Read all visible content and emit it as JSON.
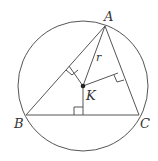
{
  "diagram": {
    "type": "geometry",
    "colors": {
      "stroke": "#555555",
      "point": "#222222",
      "background": "#ffffff"
    },
    "circle": {
      "cx": 83,
      "cy": 86,
      "r": 65
    },
    "points": {
      "A": {
        "label": "A",
        "x": 105,
        "y": 26
      },
      "B": {
        "label": "B",
        "x": 26,
        "y": 115
      },
      "C": {
        "label": "C",
        "x": 139,
        "y": 115
      },
      "K": {
        "label": "K",
        "x": 83,
        "y": 86
      }
    },
    "segment_label": {
      "text": "r",
      "on": "AK"
    },
    "right_angle_marks": [
      "foot on AB",
      "foot on AC",
      "foot on BC"
    ]
  }
}
